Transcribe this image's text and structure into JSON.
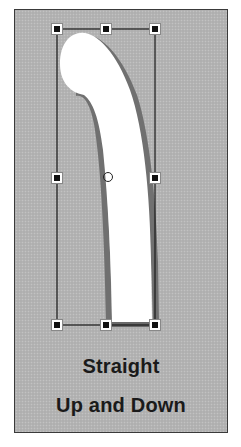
{
  "caption": {
    "line1": "Straight",
    "line2": "Up and Down"
  },
  "colors": {
    "background": "#b4b4b4",
    "frame_border": "#3a3a3a",
    "shape_fill": "#ffffff",
    "shape_shadow": "#6e6e6e",
    "bounding_box": "#1a1a1a",
    "handle_fill": "#111111",
    "handle_border": "#ffffff"
  },
  "selection": {
    "bounding_box": {
      "left": 57,
      "top": 29,
      "right": 155,
      "bottom": 325
    },
    "handles": [
      {
        "name": "top-left",
        "x": 57,
        "y": 29
      },
      {
        "name": "top-center",
        "x": 106,
        "y": 29
      },
      {
        "name": "top-right",
        "x": 155,
        "y": 29
      },
      {
        "name": "middle-left",
        "x": 57,
        "y": 178
      },
      {
        "name": "middle-right",
        "x": 155,
        "y": 178
      },
      {
        "name": "bottom-left",
        "x": 57,
        "y": 325
      },
      {
        "name": "bottom-center",
        "x": 106,
        "y": 325
      },
      {
        "name": "bottom-right",
        "x": 155,
        "y": 325
      }
    ],
    "pivot": {
      "x": 108,
      "y": 177
    }
  }
}
